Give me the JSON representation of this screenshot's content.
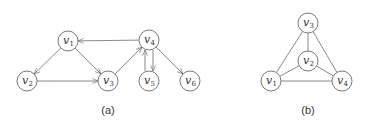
{
  "figures": [
    {
      "id": "a",
      "caption": "(a)",
      "caption_pos": [
        108,
        110
      ],
      "directed": true,
      "nodes": [
        {
          "name": "v1",
          "base": "v",
          "sub": "1",
          "x": 68,
          "y": 41
        },
        {
          "name": "v2",
          "base": "v",
          "sub": "2",
          "x": 27,
          "y": 81
        },
        {
          "name": "v3",
          "base": "v",
          "sub": "3",
          "x": 108,
          "y": 81
        },
        {
          "name": "v4",
          "base": "v",
          "sub": "4",
          "x": 149,
          "y": 40
        },
        {
          "name": "v5",
          "base": "v",
          "sub": "5",
          "x": 149,
          "y": 81
        },
        {
          "name": "v6",
          "base": "v",
          "sub": "6",
          "x": 190,
          "y": 81
        }
      ],
      "edges": [
        {
          "from": "v1",
          "to": "v2"
        },
        {
          "from": "v1",
          "to": "v3"
        },
        {
          "from": "v2",
          "to": "v3"
        },
        {
          "from": "v3",
          "to": "v4"
        },
        {
          "from": "v4",
          "to": "v1"
        },
        {
          "from": "v4",
          "to": "v5",
          "offset": -4
        },
        {
          "from": "v5",
          "to": "v4",
          "offset": -4
        },
        {
          "from": "v4",
          "to": "v6"
        }
      ]
    },
    {
      "id": "b",
      "caption": "(b)",
      "caption_pos": [
        308,
        110
      ],
      "directed": false,
      "nodes": [
        {
          "name": "v3",
          "base": "v",
          "sub": "3",
          "x": 308,
          "y": 23
        },
        {
          "name": "v2",
          "base": "v",
          "sub": "2",
          "x": 308,
          "y": 61
        },
        {
          "name": "v1",
          "base": "v",
          "sub": "1",
          "x": 271,
          "y": 81
        },
        {
          "name": "v4",
          "base": "v",
          "sub": "4",
          "x": 342,
          "y": 81
        }
      ],
      "edges": [
        {
          "from": "v3",
          "to": "v2"
        },
        {
          "from": "v3",
          "to": "v1"
        },
        {
          "from": "v3",
          "to": "v4"
        },
        {
          "from": "v2",
          "to": "v1"
        },
        {
          "from": "v2",
          "to": "v4"
        },
        {
          "from": "v1",
          "to": "v4"
        }
      ]
    }
  ],
  "style": {
    "node_radius": 10,
    "stroke": "#7a7a7a",
    "text": "#333333"
  }
}
